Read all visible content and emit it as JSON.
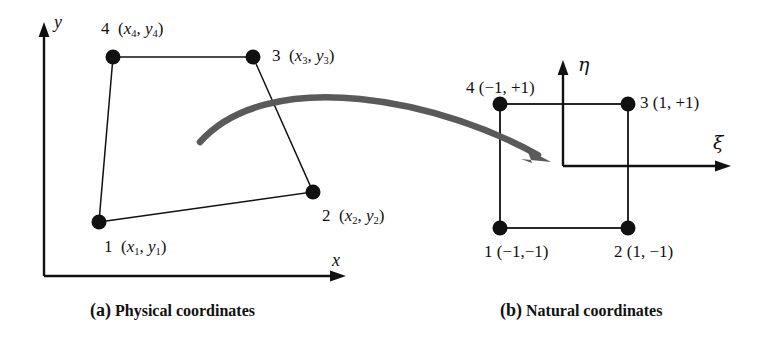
{
  "figure": {
    "background": "#ffffff",
    "line_color": "#111111",
    "node_color": "#111111",
    "arrow_color": "#5a5a5a"
  },
  "panel_a": {
    "caption_tag": "(a)",
    "caption_text": "Physical coordinates",
    "axis_x_label": "x",
    "axis_y_label": "y",
    "nodes": [
      {
        "id": "1",
        "label_num": "1",
        "label_coords": "(x1, y1)",
        "sub1": "1",
        "sub2": "1",
        "var1": "x",
        "var2": "y",
        "px": 99,
        "py": 222
      },
      {
        "id": "2",
        "label_num": "2",
        "label_coords": "(x2, y2)",
        "sub1": "2",
        "sub2": "2",
        "var1": "x",
        "var2": "y",
        "px": 313,
        "py": 192
      },
      {
        "id": "3",
        "label_num": "3",
        "label_coords": "(x3, y3)",
        "sub1": "3",
        "sub2": "3",
        "var1": "x",
        "var2": "y",
        "px": 253,
        "py": 57
      },
      {
        "id": "4",
        "label_num": "4",
        "label_coords": "(x4, y4)",
        "sub1": "4",
        "sub2": "4",
        "var1": "x",
        "var2": "y",
        "px": 113,
        "py": 57
      }
    ]
  },
  "panel_b": {
    "caption_tag": "(b)",
    "caption_text": "Natural coordinates",
    "axis_xi_label": "ξ",
    "axis_eta_label": "η",
    "nodes": [
      {
        "id": "1",
        "label": "1 (−1,−1)",
        "px": 500,
        "py": 228
      },
      {
        "id": "2",
        "label": "2 (1, −1)",
        "px": 628,
        "py": 228
      },
      {
        "id": "3",
        "label": "3 (1, +1)",
        "px": 628,
        "py": 104
      },
      {
        "id": "4",
        "label": "4 (−1, +1)",
        "px": 500,
        "py": 104
      }
    ]
  },
  "mapping_arrow": {
    "description": "curved-mapping-arrow"
  }
}
